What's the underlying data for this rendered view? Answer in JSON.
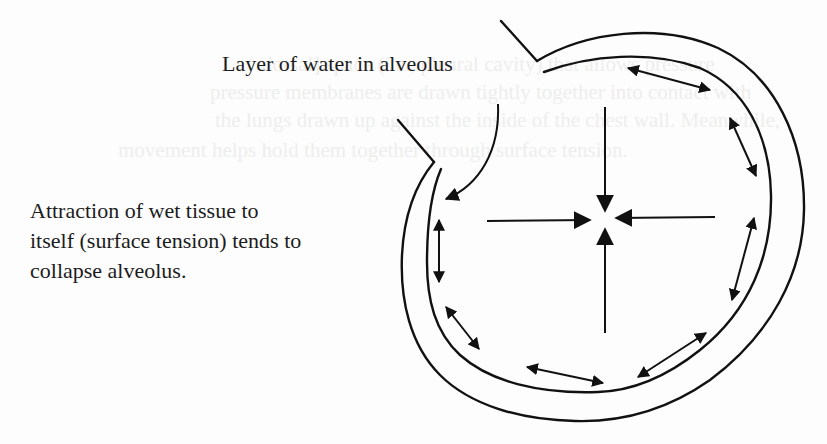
{
  "figure": {
    "type": "alveolus-surface-tension-diagram",
    "labels": {
      "top": "Layer of water in alveolus",
      "left_lines": [
        "Attraction of wet tissue to",
        "itself (surface tension) tends to",
        "collapse alveolus."
      ]
    },
    "colors": {
      "ink": "#111111",
      "text": "#1c1c1c",
      "background": "#fdfdfd",
      "bleed_through": "#eeeeee"
    },
    "center_arrows": {
      "center": [
        605,
        218
      ],
      "count": 4,
      "direction": "inward"
    },
    "wall_arrows": {
      "count": 7,
      "style": "double-headed"
    }
  },
  "bleed_through_text": [
    "dorsal] space (i.e., pleural cavity) that allows pressure",
    "pressure membranes are drawn tightly together into contact with",
    "the lungs drawn up against the inside of the chest wall. Meanwhile,",
    "movement helps hold them together through surface tension."
  ]
}
